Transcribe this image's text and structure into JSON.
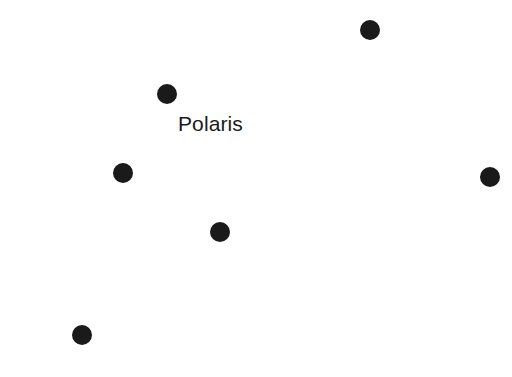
{
  "figure": {
    "kind": "star-chart",
    "background_color": "#ffffff",
    "star_color": "#1a1a1a",
    "width": 512,
    "height": 377
  },
  "stars": [
    {
      "id": "star-1",
      "name": "star-marker",
      "x": 370,
      "y": 30,
      "r": 10
    },
    {
      "id": "star-2",
      "name": "star-marker",
      "x": 167,
      "y": 94,
      "r": 10
    },
    {
      "id": "star-3",
      "name": "star-marker",
      "x": 123,
      "y": 173,
      "r": 10
    },
    {
      "id": "star-4",
      "name": "star-marker",
      "x": 490,
      "y": 177,
      "r": 10
    },
    {
      "id": "star-5",
      "name": "star-marker",
      "x": 220,
      "y": 232,
      "r": 10
    },
    {
      "id": "star-6",
      "name": "star-marker",
      "x": 82,
      "y": 335,
      "r": 10
    }
  ],
  "labels": [
    {
      "id": "label-polaris",
      "text": "Polaris",
      "x": 178,
      "y": 113,
      "font_size": 21,
      "color": "#1a1a1a",
      "refers_to": "star-2"
    }
  ]
}
